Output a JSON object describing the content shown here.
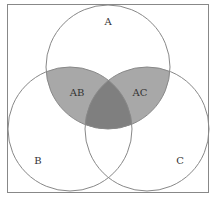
{
  "diagram": {
    "type": "venn",
    "sets": [
      {
        "id": "A",
        "label": "A",
        "cx": 108,
        "cy": 67,
        "r": 62
      },
      {
        "id": "B",
        "label": "B",
        "cx": 70,
        "cy": 129,
        "r": 62
      },
      {
        "id": "C",
        "label": "C",
        "cx": 147,
        "cy": 129,
        "r": 62
      }
    ],
    "regions": [
      {
        "id": "AB",
        "label": "AB",
        "shaded": true
      },
      {
        "id": "AC",
        "label": "AC",
        "shaded": true
      },
      {
        "id": "ABC",
        "label": "",
        "shaded": true
      }
    ],
    "colors": {
      "frame": "#888888",
      "outline": "#888888",
      "pair_fill": "#a8a8a8",
      "triple_fill": "#7f7f7f",
      "background": "#ffffff"
    }
  }
}
